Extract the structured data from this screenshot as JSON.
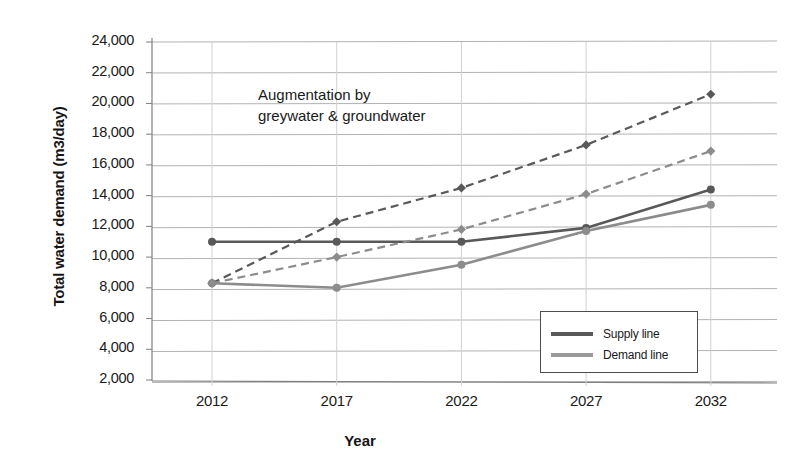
{
  "chart_data": {
    "type": "line",
    "title": "",
    "xlabel": "Year",
    "ylabel": "Total water demand (m3/day)",
    "categories": [
      "2012",
      "2017",
      "2022",
      "2027",
      "2032"
    ],
    "x": [
      2012,
      2017,
      2022,
      2027,
      2032
    ],
    "xlim": [
      2010,
      2034
    ],
    "ylim": [
      2000,
      24000
    ],
    "ytick_labels": [
      "24,000",
      "22,000",
      "20,000",
      "18,000",
      "16,000",
      "14,000",
      "12,000",
      "10,000",
      "8,000",
      "6,000",
      "4,000",
      "2,000"
    ],
    "ytick_values": [
      24000,
      22000,
      20000,
      18000,
      16000,
      14000,
      12000,
      10000,
      8000,
      6000,
      4000,
      2000
    ],
    "grid": "horizontal",
    "legend_position": "inside-bottom-right",
    "series": [
      {
        "name": "Supply line",
        "style": "solid",
        "color": "#595959",
        "marker": "circle",
        "values": [
          11000,
          11000,
          11000,
          11900,
          14400
        ]
      },
      {
        "name": "Demand line",
        "style": "solid",
        "color": "#8c8c8c",
        "marker": "circle",
        "values": [
          8300,
          8000,
          9500,
          11700,
          13400
        ]
      },
      {
        "name": "Supply line augmented",
        "style": "dashed",
        "color": "#595959",
        "marker": "diamond",
        "values": [
          8300,
          12300,
          14500,
          17300,
          20600
        ]
      },
      {
        "name": "Demand line augmented",
        "style": "dashed",
        "color": "#8c8c8c",
        "marker": "diamond",
        "values": [
          8300,
          10000,
          11800,
          14100,
          16900
        ]
      }
    ],
    "annotations": [
      {
        "text": "Augmentation by\ngreywater & groundwater",
        "x": 2013.5,
        "y": 21000
      }
    ],
    "legend": {
      "entries": [
        {
          "label": "Supply line",
          "color": "#595959"
        },
        {
          "label": "Demand line",
          "color": "#8c8c8c"
        }
      ]
    },
    "colors": {
      "supply": "#595959",
      "demand": "#8c8c8c",
      "grid": "#b3b3b3",
      "axis": "#808080",
      "text": "#1a1a1a"
    }
  },
  "annotation_line1": "Augmentation by",
  "annotation_line2": "greywater & groundwater"
}
